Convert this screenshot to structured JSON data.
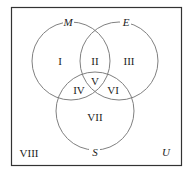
{
  "diagram": {
    "type": "venn",
    "universe_label": "U",
    "sets": [
      {
        "name": "M",
        "cx": 71,
        "cy": 61,
        "r": 39
      },
      {
        "name": "E",
        "cx": 119,
        "cy": 61,
        "r": 39
      },
      {
        "name": "S",
        "cx": 95,
        "cy": 111,
        "r": 39
      }
    ],
    "regions": [
      {
        "label": "I",
        "x": 60,
        "y": 65
      },
      {
        "label": "II",
        "x": 95,
        "y": 65
      },
      {
        "label": "III",
        "x": 129,
        "y": 65
      },
      {
        "label": "IV",
        "x": 79,
        "y": 94
      },
      {
        "label": "V",
        "x": 95,
        "y": 85
      },
      {
        "label": "VI",
        "x": 113,
        "y": 94
      },
      {
        "label": "VII",
        "x": 95,
        "y": 121
      },
      {
        "label": "VIII",
        "x": 30,
        "y": 157
      }
    ],
    "colors": {
      "stroke": "#808080",
      "frame": "#333333",
      "text": "#222222"
    }
  }
}
